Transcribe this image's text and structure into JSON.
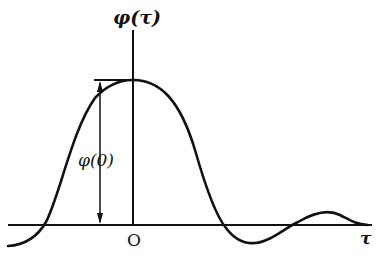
{
  "diagram": {
    "y_axis_label": "φ(τ)",
    "x_axis_label": "τ",
    "origin_label": "O",
    "peak_annotation": "φ(0)",
    "curve_color": "#111111"
  }
}
